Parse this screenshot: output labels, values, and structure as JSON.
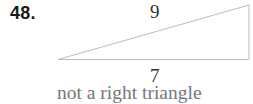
{
  "problem": {
    "number": "48.",
    "figure": {
      "shape": "triangle",
      "vertices": [
        [
          58,
          59.5
        ],
        [
          249,
          5
        ],
        [
          249,
          59.5
        ]
      ],
      "side_labels": {
        "hypotenuse_like": "9",
        "base": "7"
      },
      "stroke_color": "#bdbdbd"
    },
    "answer": "not a right triangle"
  }
}
